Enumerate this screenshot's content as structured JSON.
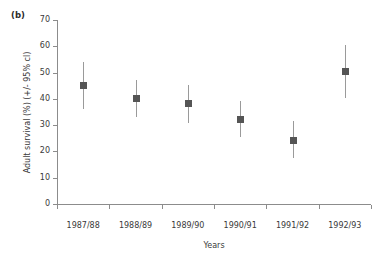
{
  "figure": {
    "panel_label": "(b)",
    "background_color": "#ffffff",
    "marker_color": "#555555",
    "errorbar_color": "#9a9a9a",
    "axis_color": "#8c8c8c"
  },
  "chart_data": {
    "type": "scatter",
    "title": "",
    "subtitle": "",
    "panel": "(b)",
    "xlabel": "Years",
    "ylabel": "Adult survival (%) (+/- 95% cl)",
    "categories": [
      "1987/88",
      "1988/89",
      "1989/90",
      "1990/91",
      "1991/92",
      "1992/93"
    ],
    "x": [
      1,
      2,
      3,
      4,
      5,
      6
    ],
    "values": [
      45.0,
      40.3,
      38.3,
      32.3,
      24.3,
      50.5
    ],
    "error_low": [
      36.0,
      33.0,
      31.0,
      25.3,
      17.5,
      40.5
    ],
    "error_high": [
      54.0,
      47.0,
      45.3,
      39.3,
      31.5,
      60.5
    ],
    "ylim": [
      0,
      70
    ],
    "yticks": [
      0,
      10,
      20,
      30,
      40,
      50,
      60,
      70
    ],
    "ytick_labels": [
      "0",
      "10",
      "20",
      "30",
      "40",
      "50",
      "60",
      "70"
    ],
    "xtick_labels": [
      "1987/88",
      "1988/89",
      "1989/90",
      "1990/91",
      "1991/92",
      "1992/93"
    ],
    "grid": false,
    "legend": false,
    "legend_position": "none",
    "marker_style": "filled-square",
    "errorbar_style": "vertical-line-no-caps",
    "annotations": []
  }
}
